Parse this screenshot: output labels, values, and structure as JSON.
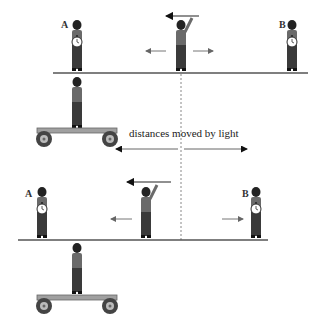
{
  "diagram": {
    "caption": "distances moved by light",
    "observer_labels": {
      "a": "A",
      "b": "B"
    },
    "scenes": [
      {
        "name": "top-scene",
        "description": "light flash emitted from middle person; both A and B with clocks on ground; observer on cart below"
      },
      {
        "name": "bottom-scene",
        "description": "later moment; people shifted left relative to the cart observer"
      }
    ],
    "colors": {
      "ink": "#2a2a2a",
      "ground": "#555555",
      "arrow": "#777777",
      "dress": "#3a3a3a",
      "top": "#6a6a6a",
      "cart": "#999999"
    }
  }
}
